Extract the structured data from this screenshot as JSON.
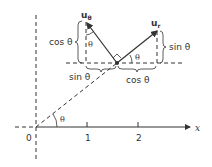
{
  "diagram": {
    "axis_x_label": "x",
    "origin_label": "0",
    "ticks": [
      "1",
      "2"
    ],
    "angle_origin": "θ",
    "vector_u_theta": {
      "label_main": "u",
      "label_sub": "θ"
    },
    "vector_u_r": {
      "label_main": "u",
      "label_sub": "r"
    },
    "components": {
      "u_theta_vertical": "cos θ",
      "u_theta_horizontal": "sin θ",
      "u_r_vertical": "sin θ",
      "u_r_horizontal": "cos θ"
    },
    "angle_at_u_theta": "θ",
    "angle_at_u_r": "θ",
    "colors": {
      "ink": "#333333",
      "background": "#ffffff"
    }
  }
}
